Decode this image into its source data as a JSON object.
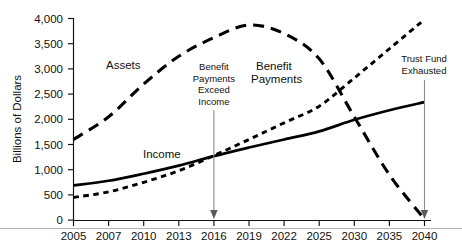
{
  "chart_data": {
    "type": "line",
    "title": "",
    "xlabel": "",
    "ylabel": "Billions of Dollars",
    "ylim": [
      0,
      4000
    ],
    "ytick_values": [
      0,
      500,
      1000,
      1500,
      2000,
      2500,
      3000,
      3500,
      4000
    ],
    "ytick_labels": [
      "0",
      "500",
      "1,000",
      "1,500",
      "2,000",
      "2,500",
      "3,000",
      "3,500",
      "4,000"
    ],
    "xtick_labels": [
      "2005",
      "2007",
      "2010",
      "2013",
      "2016",
      "2019",
      "2022",
      "2025",
      "2030",
      "2035",
      "2040"
    ],
    "grid": false,
    "legend_position": "inline-labels",
    "series": [
      {
        "name": "Assets",
        "style": "long-dash",
        "label": "Assets",
        "values": [
          1600,
          2050,
          2700,
          3250,
          3620,
          3870,
          3700,
          3200,
          2050,
          900,
          20
        ]
      },
      {
        "name": "Income",
        "style": "solid",
        "label": "Income",
        "values": [
          690,
          780,
          920,
          1080,
          1270,
          1440,
          1600,
          1760,
          1990,
          2180,
          2340
        ]
      },
      {
        "name": "Benefit Payments",
        "style": "dotted",
        "label": "Benefit Payments",
        "values": [
          450,
          560,
          750,
          980,
          1280,
          1600,
          1930,
          2260,
          2820,
          3400,
          3980
        ]
      }
    ],
    "annotations": [
      {
        "name": "benefit-payments-exceed-income",
        "lines": [
          "Benefit",
          "Payments",
          "Exceed",
          "Income"
        ],
        "target_x_label": "2016",
        "target_y": 0
      },
      {
        "name": "trust-fund-exhausted",
        "lines": [
          "Trust Fund",
          "Exhausted"
        ],
        "target_x_label": "2040",
        "target_y": 0
      }
    ]
  },
  "series_labels": {
    "assets": "Assets",
    "income": "Income",
    "benefit_payments_line1": "Benefit",
    "benefit_payments_line2": "Payments"
  },
  "annotation_text": {
    "exceed_line1": "Benefit",
    "exceed_line2": "Payments",
    "exceed_line3": "Exceed",
    "exceed_line4": "Income",
    "exhausted_line1": "Trust Fund",
    "exhausted_line2": "Exhausted"
  },
  "axis": {
    "y_title": "Billions of Dollars",
    "y0": "0",
    "y500": "500",
    "y1000": "1,000",
    "y1500": "1,500",
    "y2000": "2,000",
    "y2500": "2,500",
    "y3000": "3,000",
    "y3500": "3,500",
    "y4000": "4,000",
    "x0": "2005",
    "x1": "2007",
    "x2": "2010",
    "x3": "2013",
    "x4": "2016",
    "x5": "2019",
    "x6": "2022",
    "x7": "2025",
    "x8": "2030",
    "x9": "2035",
    "x10": "2040"
  }
}
